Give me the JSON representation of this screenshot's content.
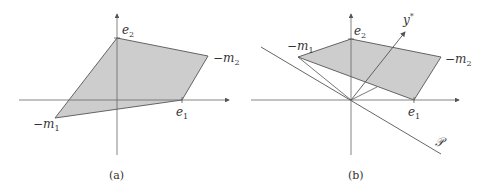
{
  "colors": {
    "fill": "#cdcdcd",
    "stroke": "#555555",
    "axis": "#666666",
    "text": "#333333"
  },
  "panels": [
    {
      "caption": "(a)",
      "labels": {
        "e2": "e",
        "e2_sub": "2",
        "e1": "e",
        "e1_sub": "1",
        "m1": "−m",
        "m1_sub": "1",
        "m2": "−m",
        "m2_sub": "2"
      },
      "vertices": {
        "e2": [
          117,
          38
        ],
        "m2": [
          208,
          56
        ],
        "e1": [
          182,
          100
        ],
        "m1": [
          55,
          118
        ]
      }
    },
    {
      "caption": "(b)",
      "labels": {
        "e2": "e",
        "e2_sub": "2",
        "e1": "e",
        "e1_sub": "1",
        "m1": "−m",
        "m1_sub": "1",
        "m2": "−m",
        "m2_sub": "2",
        "ystar": "y",
        "ystar_sup": "*",
        "plane": "𝒫"
      },
      "vertices": {
        "e2": [
          351,
          39
        ],
        "m2": [
          441,
          57
        ],
        "e1": [
          414,
          100
        ],
        "m1": [
          298,
          57
        ]
      }
    }
  ]
}
